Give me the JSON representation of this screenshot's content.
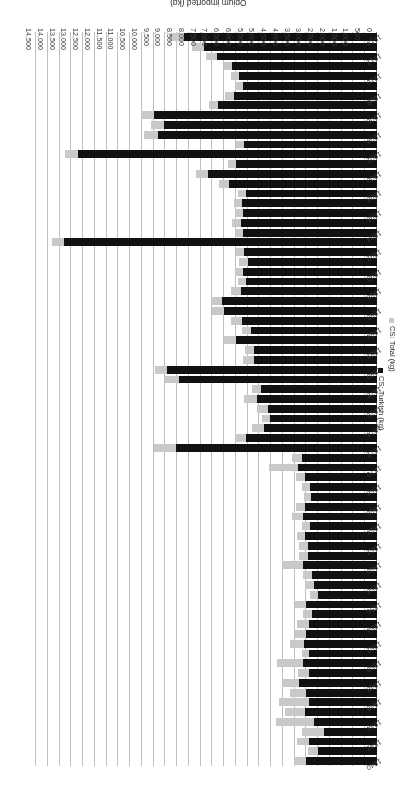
{
  "chart_data": {
    "type": "bar",
    "orientation": "horizontal",
    "title": "",
    "xlabel": "Opium imported (kg)",
    "ylabel": "",
    "xlim": [
      0,
      14500
    ],
    "tick_step": 500,
    "grid": true,
    "legend_position": "left",
    "bar_style": "overlapped",
    "x_tick_labels": [
      "0",
      "500",
      "1,000",
      "1,500",
      "2,000",
      "2,500",
      "3,000",
      "3,500",
      "4,000",
      "4,500",
      "5,000",
      "5,500",
      "6,000",
      "6,500",
      "7,000",
      "7,500",
      "8,000",
      "8,500",
      "9,000",
      "9,500",
      "10,000",
      "10,500",
      "11,000",
      "11,500",
      "12,000",
      "12,500",
      "13,000",
      "13,500",
      "14,000",
      "14,500"
    ],
    "categories": [
      1840,
      1841,
      1842,
      1843,
      1844,
      1845,
      1846,
      1847,
      1848,
      1849,
      1850,
      1851,
      1852,
      1853,
      1854,
      1855,
      1856,
      1857,
      1858,
      1859,
      1860,
      1861,
      1862,
      1863,
      1864,
      1865,
      1866,
      1867,
      1868,
      1869,
      1870,
      1871,
      1872,
      1873,
      1874,
      1875,
      1876,
      1877,
      1878,
      1879,
      1880,
      1881,
      1882,
      1883,
      1884,
      1885,
      1886,
      1887,
      1888,
      1889,
      1890,
      1891,
      1892,
      1893,
      1894,
      1895,
      1896,
      1897,
      1898,
      1899,
      1900,
      1901,
      1902,
      1903,
      1904,
      1905,
      1906,
      1907,
      1908,
      1909,
      1910,
      1911,
      1912,
      1913,
      1914
    ],
    "category_label_step": 2,
    "series": [
      {
        "name": "CS: Total (kg)",
        "color": "#c9c9c9",
        "values": [
          3550,
          2950,
          3400,
          3200,
          4300,
          3900,
          4150,
          3700,
          4050,
          3350,
          4250,
          3200,
          3700,
          3500,
          3400,
          3150,
          3500,
          2850,
          3050,
          3150,
          4050,
          3300,
          3300,
          3400,
          3200,
          3600,
          3450,
          3100,
          3200,
          3450,
          4600,
          3600,
          9500,
          6050,
          5300,
          4900,
          5100,
          5650,
          5300,
          9000,
          9450,
          5700,
          5600,
          6500,
          5750,
          6200,
          7000,
          7050,
          6200,
          5900,
          6050,
          5850,
          6000,
          13800,
          6050,
          6150,
          6050,
          6100,
          5900,
          6700,
          7700,
          6350,
          13250,
          6000,
          9900,
          9600,
          10050,
          7150,
          6450,
          6050,
          6200,
          6500,
          7250,
          7850,
          8850
        ]
      },
      {
        "name": "CS: Turkish (kg)",
        "color": "#111111",
        "values": [
          3000,
          2500,
          2900,
          2250,
          2700,
          3050,
          2900,
          3000,
          3300,
          2900,
          3150,
          2900,
          3100,
          3000,
          2900,
          2750,
          3000,
          2500,
          2700,
          2750,
          3150,
          2950,
          2950,
          3050,
          2850,
          3150,
          3050,
          2800,
          2850,
          3050,
          3350,
          3200,
          8550,
          5550,
          4800,
          4550,
          4650,
          5100,
          4950,
          8400,
          8950,
          5250,
          5250,
          6000,
          5350,
          5750,
          6500,
          6600,
          5800,
          5550,
          5700,
          5500,
          5650,
          13300,
          5700,
          5800,
          5700,
          5750,
          5550,
          6300,
          7200,
          6000,
          12700,
          5650,
          9300,
          9050,
          9500,
          6750,
          6100,
          5700,
          5850,
          6150,
          6800,
          7350,
          8200
        ]
      }
    ]
  },
  "axis": {
    "value_axis_title": "Opium imported (kg)"
  },
  "legend": {
    "items": [
      {
        "label": "CS: Total (kg)",
        "color": "#c9c9c9",
        "key": "total"
      },
      {
        "label": "CS: Turkish (kg)",
        "color": "#111111",
        "key": "turkish"
      }
    ]
  }
}
